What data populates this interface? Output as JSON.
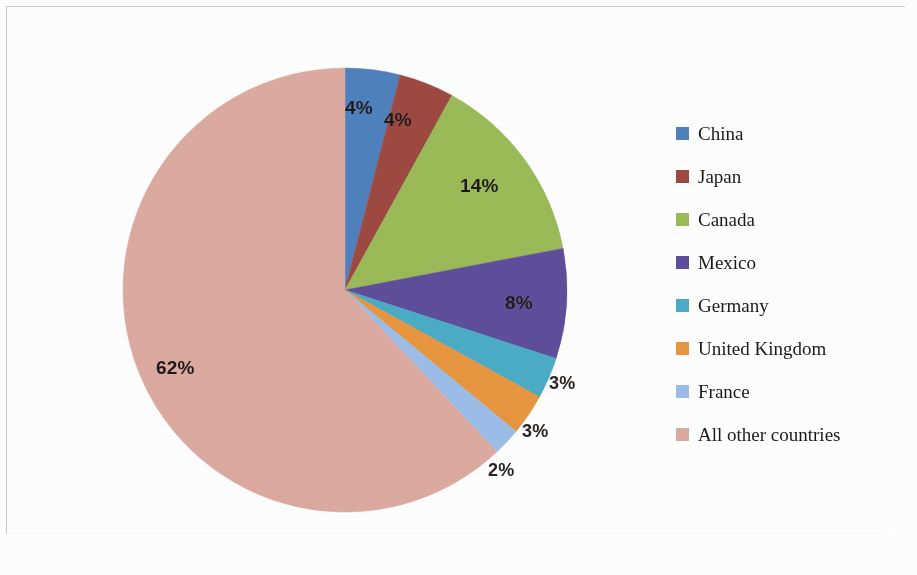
{
  "chart_data": {
    "type": "pie",
    "title": "",
    "subtitle": "",
    "xlabel": "",
    "ylabel": "",
    "grid": false,
    "legend_position": "right",
    "start_angle_deg": 0,
    "direction": "clockwise",
    "categories": [
      "China",
      "Japan",
      "Canada",
      "Mexico",
      "Germany",
      "United Kingdom",
      "France",
      "All other countries"
    ],
    "values": [
      4,
      4,
      14,
      8,
      3,
      3,
      2,
      62
    ],
    "value_unit": "%",
    "data_labels": [
      "4%",
      "4%",
      "14%",
      "8%",
      "3%",
      "3%",
      "2%",
      "62%"
    ],
    "colors": [
      "#4f81bd",
      "#9e4a41",
      "#9bbb59",
      "#5f4e9c",
      "#4bacc6",
      "#e8963f",
      "#9bbde8",
      "#dcaaa0"
    ]
  },
  "pie": {
    "slices": [
      {
        "label": "China",
        "percent_text": "4%",
        "value": 4,
        "color": "#4f81bd",
        "label_x": 223,
        "label_y": 30,
        "label_placement": "inside"
      },
      {
        "label": "Japan",
        "percent_text": "4%",
        "value": 4,
        "color": "#9e4a41",
        "label_x": 262,
        "label_y": 42,
        "label_placement": "inside"
      },
      {
        "label": "Canada",
        "percent_text": "14%",
        "value": 14,
        "color": "#9bbb59",
        "label_x": 338,
        "label_y": 108,
        "label_placement": "inside"
      },
      {
        "label": "Mexico",
        "percent_text": "8%",
        "value": 8,
        "color": "#5f4e9c",
        "label_x": 383,
        "label_y": 225,
        "label_placement": "inside"
      },
      {
        "label": "Germany",
        "percent_text": "3%",
        "value": 3,
        "color": "#4bacc6",
        "label_x": 427,
        "label_y": 306,
        "label_placement": "outside"
      },
      {
        "label": "United Kingdom",
        "percent_text": "3%",
        "value": 3,
        "color": "#e8963f",
        "label_x": 400,
        "label_y": 354,
        "label_placement": "outside"
      },
      {
        "label": "France",
        "percent_text": "2%",
        "value": 2,
        "color": "#9bbde8",
        "label_x": 366,
        "label_y": 393,
        "label_placement": "outside"
      },
      {
        "label": "All other countries",
        "percent_text": "62%",
        "value": 62,
        "color": "#dcaaa0",
        "label_x": 34,
        "label_y": 290,
        "label_placement": "inside"
      }
    ]
  },
  "legend": {
    "items": [
      {
        "label": "China",
        "color": "#4f81bd"
      },
      {
        "label": "Japan",
        "color": "#9e4a41"
      },
      {
        "label": "Canada",
        "color": "#9bbb59"
      },
      {
        "label": "Mexico",
        "color": "#5f4e9c"
      },
      {
        "label": "Germany",
        "color": "#4bacc6"
      },
      {
        "label": "United Kingdom",
        "color": "#e8963f"
      },
      {
        "label": "France",
        "color": "#9bbde8"
      },
      {
        "label": "All other countries",
        "color": "#dcaaa0"
      }
    ]
  }
}
